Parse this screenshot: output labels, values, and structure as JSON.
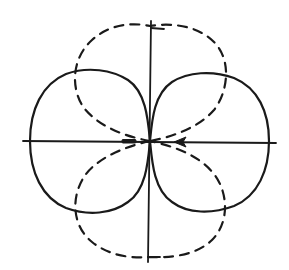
{
  "figure": {
    "colors": {
      "stroke": "#1a1a1a",
      "background": "#ffffff"
    },
    "center": {
      "x": 150,
      "y": 141
    },
    "solid_pattern": {
      "style": "solid",
      "orientation": "horizontal",
      "lobe_left_extent_x": 30,
      "lobe_right_extent_x": 269,
      "lobe_top_y": 70,
      "lobe_bottom_y": 213
    },
    "dashed_pattern": {
      "style": "dashed",
      "orientation": "vertical",
      "lobe_top_y": 26,
      "lobe_bottom_y": 257,
      "lobe_left_extent_x": 74,
      "lobe_right_extent_x": 224
    },
    "axes": {
      "horizontal": {
        "x1": 23,
        "x2": 276,
        "y": 141
      },
      "vertical": {
        "x": 150,
        "y1": 21,
        "y2": 262
      }
    },
    "arrows": [
      {
        "position_x": 128,
        "direction": "left",
        "style": "filled-bar"
      },
      {
        "position_x": 178,
        "direction": "left",
        "style": "arrowhead"
      }
    ]
  }
}
